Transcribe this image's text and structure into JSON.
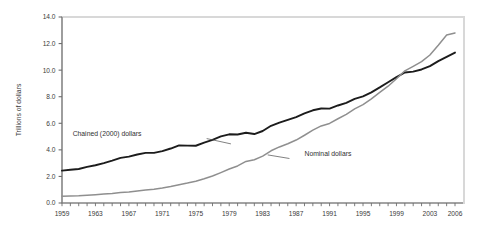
{
  "chart_data": {
    "type": "line",
    "title": "",
    "xlabel": "",
    "ylabel": "Trillions of dollars",
    "xlim": [
      1959,
      2006
    ],
    "ylim": [
      0.0,
      14.0
    ],
    "grid": false,
    "legend_position": "inline-annotations",
    "y_ticks": [
      "0.0",
      "2.0",
      "4.0",
      "6.0",
      "8.0",
      "10.0",
      "12.0",
      "14.0"
    ],
    "y_tick_values": [
      0.0,
      2.0,
      4.0,
      6.0,
      8.0,
      10.0,
      12.0,
      14.0
    ],
    "x_tick_labels": [
      "1959",
      "1963",
      "1967",
      "1971",
      "1975",
      "1979",
      "1983",
      "1987",
      "1991",
      "1995",
      "1999",
      "2003",
      "2006"
    ],
    "x_tick_values": [
      1959,
      1963,
      1967,
      1971,
      1975,
      1979,
      1983,
      1987,
      1991,
      1995,
      1999,
      2003,
      2006
    ],
    "x_minor_tick_values": [
      1959,
      1960,
      1961,
      1962,
      1963,
      1964,
      1965,
      1966,
      1967,
      1968,
      1969,
      1970,
      1971,
      1972,
      1973,
      1974,
      1975,
      1976,
      1977,
      1978,
      1979,
      1980,
      1981,
      1982,
      1983,
      1984,
      1985,
      1986,
      1987,
      1988,
      1989,
      1990,
      1991,
      1992,
      1993,
      1994,
      1995,
      1996,
      1997,
      1998,
      1999,
      2000,
      2001,
      2002,
      2003,
      2004,
      2005,
      2006
    ],
    "x": [
      1959,
      1960,
      1961,
      1962,
      1963,
      1964,
      1965,
      1966,
      1967,
      1968,
      1969,
      1970,
      1971,
      1972,
      1973,
      1974,
      1975,
      1976,
      1977,
      1978,
      1979,
      1980,
      1981,
      1982,
      1983,
      1984,
      1985,
      1986,
      1987,
      1988,
      1989,
      1990,
      1991,
      1992,
      1993,
      1994,
      1995,
      1996,
      1997,
      1998,
      1999,
      2000,
      2001,
      2002,
      2003,
      2004,
      2005,
      2006
    ],
    "series": [
      {
        "name": "Chained (2000) dollars",
        "color": "#1c1c1c",
        "width": 1.9,
        "label_x": 1968.5,
        "label_y": 5.05,
        "leader": [
          [
            1976.3,
            4.85
          ],
          [
            1979.2,
            4.45
          ]
        ],
        "values": [
          2.44,
          2.5,
          2.56,
          2.72,
          2.84,
          3.0,
          3.19,
          3.4,
          3.49,
          3.65,
          3.77,
          3.77,
          3.9,
          4.1,
          4.34,
          4.32,
          4.31,
          4.54,
          4.75,
          5.01,
          5.17,
          5.16,
          5.29,
          5.19,
          5.42,
          5.81,
          6.05,
          6.26,
          6.47,
          6.74,
          6.98,
          7.11,
          7.1,
          7.34,
          7.54,
          7.84,
          8.03,
          8.33,
          8.7,
          9.09,
          9.47,
          9.82,
          9.89,
          10.05,
          10.3,
          10.68,
          11.0,
          11.32
        ]
      },
      {
        "name": "Nominal dollars",
        "color": "#8f8f8f",
        "width": 1.5,
        "label_x": 1988.0,
        "label_y": 3.55,
        "leader": [
          [
            1986.2,
            3.35
          ],
          [
            1983.6,
            3.62
          ]
        ],
        "values": [
          0.51,
          0.53,
          0.55,
          0.59,
          0.63,
          0.67,
          0.72,
          0.79,
          0.83,
          0.91,
          0.98,
          1.04,
          1.13,
          1.24,
          1.38,
          1.5,
          1.64,
          1.82,
          2.03,
          2.29,
          2.56,
          2.79,
          3.13,
          3.26,
          3.53,
          3.93,
          4.22,
          4.46,
          4.74,
          5.1,
          5.48,
          5.8,
          5.99,
          6.34,
          6.67,
          7.09,
          7.41,
          7.84,
          8.33,
          8.79,
          9.35,
          9.95,
          10.29,
          10.64,
          11.14,
          11.87,
          12.64,
          12.8
        ]
      }
    ]
  },
  "annotations": {
    "chained_label": "Chained (2000) dollars",
    "nominal_label": "Nominal dollars"
  },
  "colors": {
    "chained_line": "#1c1c1c",
    "nominal_line": "#8f8f8f",
    "axis": "#6e6e6e",
    "frame": "#d8d8d8",
    "text": "#3a3a3a",
    "background": "#ffffff"
  }
}
